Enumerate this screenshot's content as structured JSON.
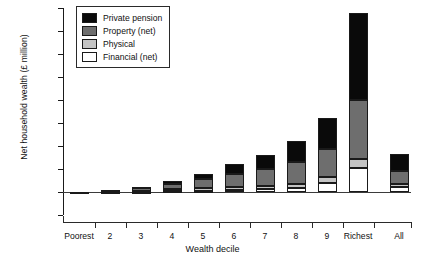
{
  "chart_data": {
    "type": "bar",
    "stacked": true,
    "title": "",
    "xlabel": "Wealth decile",
    "ylabel": "Net household wealth (£ million)",
    "categories": [
      "Poorest",
      "2",
      "3",
      "4",
      "5",
      "6",
      "7",
      "8",
      "9",
      "Richest",
      "All"
    ],
    "series": [
      {
        "name": "Financial (net)",
        "color": "#ffffff",
        "values": [
          0.0,
          0.01,
          0.01,
          0.02,
          0.03,
          0.04,
          0.06,
          0.09,
          0.2,
          0.52,
          0.1
        ]
      },
      {
        "name": "Physical",
        "color": "#c4c4c4",
        "values": [
          0.0,
          0.01,
          0.02,
          0.04,
          0.05,
          0.06,
          0.07,
          0.09,
          0.13,
          0.2,
          0.07
        ]
      },
      {
        "name": "Property (net)",
        "color": "#6e6e6e",
        "values": [
          0.01,
          0.03,
          0.05,
          0.12,
          0.21,
          0.3,
          0.37,
          0.47,
          0.6,
          1.28,
          0.29
        ]
      },
      {
        "name": "Private pension",
        "color": "#0a0a0a",
        "values": [
          0.0,
          0.0,
          0.02,
          0.06,
          0.11,
          0.2,
          0.3,
          0.45,
          0.69,
          1.9,
          0.37
        ]
      }
    ],
    "totals": [
      0.01,
      0.05,
      0.1,
      0.24,
      0.4,
      0.6,
      0.8,
      1.1,
      1.62,
      3.9,
      0.83
    ],
    "ylim": [
      -0.5,
      4.0
    ],
    "yticks": [
      -0.5,
      0.0,
      0.5,
      1.0,
      1.5,
      2.0,
      2.5,
      3.0,
      3.5,
      4.0
    ],
    "ytick_labels": [
      "-£0.5",
      "£0.0",
      "£0.5",
      "£1.0",
      "£1.5",
      "£2.0",
      "£2.5",
      "£3.0",
      "£3.5",
      "£4.0"
    ],
    "grid": false,
    "legend_position": "top-left",
    "legend_entries": [
      "Private pension",
      "Property (net)",
      "Physical",
      "Financial (net)"
    ]
  }
}
